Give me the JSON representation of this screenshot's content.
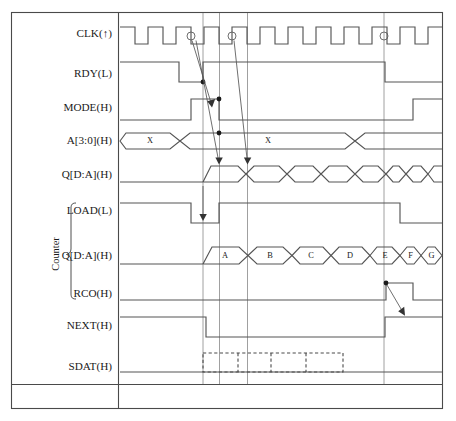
{
  "diagram": {
    "colors": {
      "frame": "#4a4a4a",
      "wave": "#555555",
      "cursor": "#888888",
      "text": "#1a1a1a",
      "background": "#ffffff"
    },
    "group": {
      "label": "Counter",
      "members": [
        "LOAD(L)",
        "Q[D:A](H)",
        "RCO(H)"
      ]
    },
    "signals": [
      {
        "name": "clk",
        "label": "CLK(↑)",
        "type": "clock",
        "pulses": 12,
        "edge_markers": 3
      },
      {
        "name": "rdy",
        "label": "RDY(L)",
        "type": "digital",
        "levels": [
          "H",
          "L",
          "H",
          "L"
        ]
      },
      {
        "name": "mode",
        "label": "MODE(H)",
        "type": "digital",
        "levels": [
          "L",
          "H",
          "L",
          "H"
        ]
      },
      {
        "name": "addr",
        "label": "A[3:0](H)",
        "type": "bus",
        "segment_labels": [
          "X",
          "",
          "X",
          ""
        ]
      },
      {
        "name": "q_top",
        "label": "Q[D:A](H)",
        "type": "bus",
        "segment_labels": [
          "",
          "",
          "",
          "",
          "",
          "",
          "",
          "",
          ""
        ]
      },
      {
        "name": "load",
        "label": "LOAD(L)",
        "type": "digital",
        "levels": [
          "H",
          "L",
          "H",
          "L"
        ]
      },
      {
        "name": "q_counter",
        "label": "Q[D:A](H)",
        "type": "bus",
        "segment_labels": [
          "A",
          "B",
          "C",
          "D",
          "E",
          "F",
          "G",
          ""
        ]
      },
      {
        "name": "rco",
        "label": "RCO(H)",
        "type": "digital",
        "levels": [
          "L",
          "H",
          "L"
        ]
      },
      {
        "name": "next",
        "label": "NEXT(H)",
        "type": "digital",
        "levels": [
          "H",
          "L",
          "H"
        ]
      },
      {
        "name": "sdat",
        "label": "SDAT(H)",
        "type": "dashed",
        "cells": 4
      }
    ]
  }
}
